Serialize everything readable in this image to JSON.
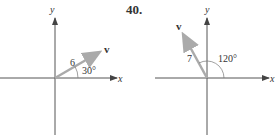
{
  "problem_number": "40.",
  "figures": [
    {
      "x_label": "x",
      "y_label": "y",
      "vector_label": "v",
      "magnitude_label": "6",
      "angle_label": "30°"
    },
    {
      "x_label": "x",
      "y_label": "y",
      "vector_label": "v",
      "magnitude_label": "7",
      "angle_label": "120°"
    }
  ],
  "colors": {
    "axis": "#555555",
    "vector": "#aaaaaa",
    "text": "#333333"
  }
}
